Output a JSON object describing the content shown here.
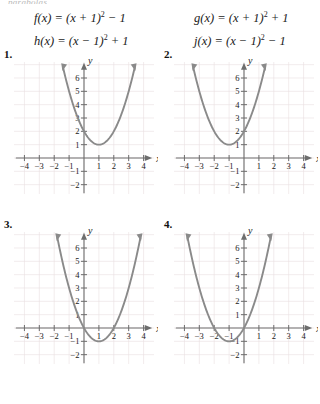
{
  "page": {
    "cut_header": "parabolas",
    "background": "#ffffff",
    "curve_color": "#8a8a8a",
    "axis_color": "#6e6e6e",
    "grid_color": "#e9dfe0"
  },
  "equations": {
    "left": [
      {
        "name": "f",
        "text": "f(x) = (x + 1)² − 1"
      },
      {
        "name": "h",
        "text": "h(x) = (x − 1)² + 1"
      }
    ],
    "right": [
      {
        "name": "g",
        "text": "g(x) = (x + 1)² + 1"
      },
      {
        "name": "j",
        "text": "j(x) = (x − 1)² − 1"
      }
    ]
  },
  "problems": [
    {
      "number": "1."
    },
    {
      "number": "2."
    },
    {
      "number": "3."
    },
    {
      "number": "4."
    }
  ],
  "chart_data": [
    {
      "type": "line",
      "title": "1.",
      "function": "y = (x - 1)^2 + 1",
      "vertex": [
        1,
        1
      ],
      "xlabel": "x",
      "ylabel": "y",
      "xlim": [
        -4.7,
        4.7
      ],
      "ylim": [
        -2.7,
        7.2
      ],
      "xticks": [
        -4,
        -3,
        -2,
        -1,
        1,
        2,
        3,
        4
      ],
      "yticks": [
        -2,
        -1,
        1,
        2,
        3,
        4,
        5,
        6
      ],
      "xtick_labels": [
        "-4",
        "-3",
        "-2",
        "-1",
        "1",
        "2",
        "3",
        "4"
      ],
      "ytick_labels": [
        "-2",
        "-1",
        "1",
        "2",
        "3",
        "4",
        "5",
        "6"
      ],
      "grid": true,
      "legend": "none",
      "points": [
        {
          "x": -1.5,
          "y": 7.25
        },
        {
          "x": -1,
          "y": 5
        },
        {
          "x": -0.5,
          "y": 3.25
        },
        {
          "x": 0,
          "y": 2
        },
        {
          "x": 0.5,
          "y": 1.25
        },
        {
          "x": 1,
          "y": 1
        },
        {
          "x": 1.5,
          "y": 1.25
        },
        {
          "x": 2,
          "y": 2
        },
        {
          "x": 2.5,
          "y": 3.25
        },
        {
          "x": 3,
          "y": 5
        },
        {
          "x": 3.5,
          "y": 7.25
        }
      ]
    },
    {
      "type": "line",
      "title": "2.",
      "function": "y = (x + 1)^2 + 1",
      "vertex": [
        -1,
        1
      ],
      "xlabel": "x",
      "ylabel": "y",
      "xlim": [
        -4.7,
        4.7
      ],
      "ylim": [
        -2.7,
        7.2
      ],
      "xticks": [
        -4,
        -3,
        -2,
        -1,
        1,
        2,
        3,
        4
      ],
      "yticks": [
        -2,
        -1,
        1,
        2,
        3,
        4,
        5,
        6
      ],
      "xtick_labels": [
        "-4",
        "-3",
        "-2",
        "-1",
        "1",
        "2",
        "3",
        "4"
      ],
      "ytick_labels": [
        "-2",
        "-1",
        "1",
        "2",
        "3",
        "4",
        "5",
        "6"
      ],
      "grid": true,
      "legend": "none",
      "points": [
        {
          "x": -3.5,
          "y": 7.25
        },
        {
          "x": -3,
          "y": 5
        },
        {
          "x": -2.5,
          "y": 3.25
        },
        {
          "x": -2,
          "y": 2
        },
        {
          "x": -1.5,
          "y": 1.25
        },
        {
          "x": -1,
          "y": 1
        },
        {
          "x": -0.5,
          "y": 1.25
        },
        {
          "x": 0,
          "y": 2
        },
        {
          "x": 0.5,
          "y": 3.25
        },
        {
          "x": 1,
          "y": 5
        },
        {
          "x": 1.5,
          "y": 7.25
        }
      ]
    },
    {
      "type": "line",
      "title": "3.",
      "function": "y = (x - 1)^2 - 1",
      "vertex": [
        1,
        -1
      ],
      "xlabel": "x",
      "ylabel": "y",
      "xlim": [
        -4.7,
        4.7
      ],
      "ylim": [
        -2.7,
        7.2
      ],
      "xticks": [
        -4,
        -3,
        -2,
        -1,
        1,
        2,
        3,
        4
      ],
      "yticks": [
        -2,
        -1,
        1,
        2,
        3,
        4,
        5,
        6
      ],
      "xtick_labels": [
        "-4",
        "-3",
        "-2",
        "-1",
        "1",
        "2",
        "3",
        "4"
      ],
      "ytick_labels": [
        "-2",
        "-1",
        "1",
        "2",
        "3",
        "4",
        "5",
        "6"
      ],
      "grid": true,
      "legend": "none",
      "points": [
        {
          "x": -1.8,
          "y": 6.84
        },
        {
          "x": -1.5,
          "y": 5.25
        },
        {
          "x": -1,
          "y": 3
        },
        {
          "x": -0.5,
          "y": 1.25
        },
        {
          "x": 0,
          "y": 0
        },
        {
          "x": 0.5,
          "y": -0.75
        },
        {
          "x": 1,
          "y": -1
        },
        {
          "x": 1.5,
          "y": -0.75
        },
        {
          "x": 2,
          "y": 0
        },
        {
          "x": 2.5,
          "y": 1.25
        },
        {
          "x": 3,
          "y": 3
        },
        {
          "x": 3.5,
          "y": 5.25
        },
        {
          "x": 3.8,
          "y": 6.84
        }
      ]
    },
    {
      "type": "line",
      "title": "4.",
      "function": "y = (x + 1)^2 - 1",
      "vertex": [
        -1,
        -1
      ],
      "xlabel": "x",
      "ylabel": "y",
      "xlim": [
        -4.7,
        4.7
      ],
      "ylim": [
        -2.7,
        7.2
      ],
      "xticks": [
        -4,
        -3,
        -2,
        -1,
        1,
        2,
        3,
        4
      ],
      "yticks": [
        -2,
        -1,
        1,
        2,
        3,
        4,
        5,
        6
      ],
      "xtick_labels": [
        "-4",
        "-3",
        "-2",
        "-1",
        "1",
        "2",
        "3",
        "4"
      ],
      "ytick_labels": [
        "-2",
        "-1",
        "1",
        "2",
        "3",
        "4",
        "5",
        "6"
      ],
      "grid": true,
      "legend": "none",
      "points": [
        {
          "x": -3.8,
          "y": 6.84
        },
        {
          "x": -3.5,
          "y": 5.25
        },
        {
          "x": -3,
          "y": 3
        },
        {
          "x": -2.5,
          "y": 1.25
        },
        {
          "x": -2,
          "y": 0
        },
        {
          "x": -1.5,
          "y": -0.75
        },
        {
          "x": -1,
          "y": -1
        },
        {
          "x": -0.5,
          "y": -0.75
        },
        {
          "x": 0,
          "y": 0
        },
        {
          "x": 0.5,
          "y": 1.25
        },
        {
          "x": 1,
          "y": 3
        },
        {
          "x": 1.5,
          "y": 5.25
        },
        {
          "x": 1.8,
          "y": 6.84
        }
      ]
    }
  ]
}
